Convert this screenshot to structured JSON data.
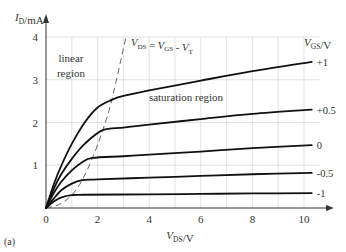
{
  "chart_data": {
    "type": "line",
    "title": "",
    "panel_label": "(a)",
    "xlabel": "V_DS/V",
    "ylabel": "I_D/mA",
    "xlim": [
      0,
      10.5
    ],
    "ylim": [
      0,
      4.3
    ],
    "xticks": [
      0,
      2,
      4,
      6,
      8,
      10
    ],
    "yticks": [
      1,
      2,
      3,
      4
    ],
    "grid": {
      "x_step": 1,
      "y_step": 1,
      "on": true
    },
    "legend_title": "V_GS/V",
    "annotations": {
      "linear_region": [
        "linear",
        "region"
      ],
      "saturation_region": "saturation region",
      "boundary_equation": "V_DS = V_GS - V_T"
    },
    "boundary_line": {
      "style": "dashed",
      "x": [
        0,
        0.5,
        1.0,
        1.4,
        1.8,
        2.2,
        2.55,
        3.1
      ],
      "y": [
        0,
        0.08,
        0.3,
        0.65,
        1.17,
        1.82,
        2.53,
        4.0
      ]
    },
    "series": [
      {
        "name": "+1",
        "label": "+1",
        "knee": [
          2.55,
          2.53
        ],
        "x": [
          0,
          0.3,
          0.6,
          1.0,
          1.5,
          2.0,
          2.55,
          3.0,
          4,
          6,
          8,
          10.3
        ],
        "y": [
          0,
          0.55,
          1.0,
          1.5,
          2.0,
          2.35,
          2.53,
          2.62,
          2.75,
          2.98,
          3.2,
          3.42
        ]
      },
      {
        "name": "+0.5",
        "label": "+0.5",
        "knee": [
          2.2,
          1.82
        ],
        "x": [
          0,
          0.3,
          0.6,
          1.0,
          1.5,
          2.2,
          3.0,
          4,
          6,
          8,
          10.3
        ],
        "y": [
          0,
          0.45,
          0.8,
          1.15,
          1.5,
          1.82,
          1.88,
          1.95,
          2.08,
          2.2,
          2.3
        ]
      },
      {
        "name": "0",
        "label": "0",
        "knee": [
          1.8,
          1.17
        ],
        "x": [
          0,
          0.3,
          0.6,
          1.0,
          1.4,
          1.8,
          3.0,
          4,
          6,
          8,
          10.3
        ],
        "y": [
          0,
          0.35,
          0.62,
          0.88,
          1.07,
          1.17,
          1.21,
          1.25,
          1.32,
          1.4,
          1.47
        ]
      },
      {
        "name": "-0.5",
        "label": "-0.5",
        "knee": [
          1.4,
          0.65
        ],
        "x": [
          0,
          0.3,
          0.6,
          1.0,
          1.4,
          2.0,
          4,
          6,
          8,
          10.3
        ],
        "y": [
          0,
          0.22,
          0.42,
          0.57,
          0.65,
          0.67,
          0.71,
          0.75,
          0.79,
          0.82
        ]
      },
      {
        "name": "-1",
        "label": "-1",
        "knee": [
          1.0,
          0.3
        ],
        "x": [
          0,
          0.3,
          0.6,
          1.0,
          1.5,
          4,
          6,
          8,
          10.3
        ],
        "y": [
          0,
          0.15,
          0.25,
          0.3,
          0.31,
          0.32,
          0.33,
          0.34,
          0.35
        ]
      }
    ]
  }
}
